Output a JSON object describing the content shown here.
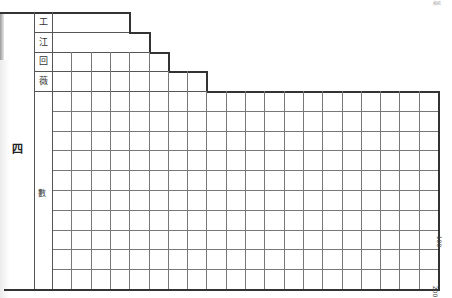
{
  "document": {
    "type": "manuscript-grid-page",
    "section_label": "四",
    "row_labels": [
      "工",
      "江",
      "回",
      "薇"
    ],
    "side_label": "數",
    "margin_numbers": {
      "middle": "100",
      "bottom": "200"
    },
    "corner_note": "稿紙"
  },
  "grid": {
    "columns": 20,
    "rows_full": 10,
    "step_rows": [
      {
        "label_index": 0,
        "ends_at_column": 4
      },
      {
        "label_index": 1,
        "ends_at_column": 5
      },
      {
        "label_index": 2,
        "ends_at_column": 6
      },
      {
        "label_index": 3,
        "ends_at_column": 8
      }
    ],
    "line_color": "#555555"
  }
}
